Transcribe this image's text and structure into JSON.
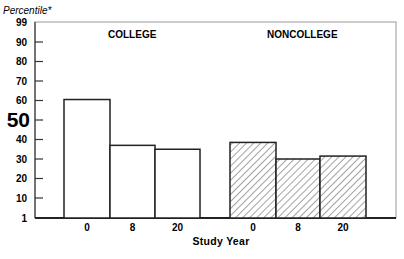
{
  "chart_data": {
    "type": "bar",
    "title": "",
    "ylabel": "Percentile*",
    "xlabel": "Study Year",
    "ylim": [
      1,
      99
    ],
    "yticks": [
      99,
      90,
      80,
      70,
      60,
      50,
      40,
      30,
      20,
      10,
      1
    ],
    "y_emphasized_tick": 50,
    "grid": false,
    "legend": null,
    "groups": [
      "COLLEGE",
      "NONCOLLEGE"
    ],
    "categories": [
      "0",
      "8",
      "20"
    ],
    "series": [
      {
        "name": "COLLEGE",
        "fill": "white",
        "values": [
          60.5,
          37,
          35
        ]
      },
      {
        "name": "NONCOLLEGE",
        "fill": "hatched",
        "values": [
          38.5,
          30,
          31.5
        ]
      }
    ]
  },
  "labels": {
    "ylabel": "Percentile*",
    "xlabel": "Study Year",
    "college": "COLLEGE",
    "noncollege": "NONCOLLEGE",
    "big_tick": "50"
  }
}
